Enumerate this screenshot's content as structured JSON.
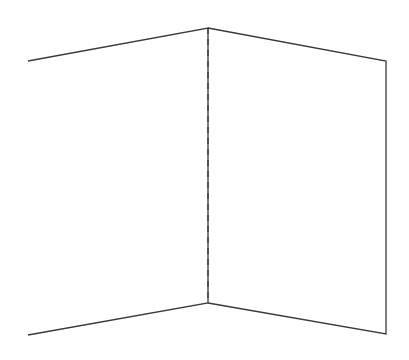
{
  "diagram": {
    "stroke_color": "#3a3a3a",
    "background": "#ffffff",
    "left_panel": {
      "points": "28,61 208,28 208,303 28,335"
    },
    "right_panel": {
      "points": "208,28 386,61 386,334 208,303"
    },
    "fold_line": {
      "x1": 208,
      "y1": 28,
      "x2": 208,
      "y2": 303,
      "dash": "6,5"
    }
  }
}
